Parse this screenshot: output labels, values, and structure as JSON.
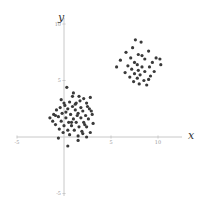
{
  "chart_data": {
    "type": "scatter",
    "title": "",
    "xlabel": "x",
    "ylabel": "y",
    "xlim": [
      -5,
      12
    ],
    "ylim": [
      -5,
      10
    ],
    "grid": false,
    "legend": "none",
    "x_ticks": [
      -5,
      5,
      10
    ],
    "y_ticks": [
      -5,
      5,
      10
    ],
    "x_tick_labels": [
      "-5",
      "5",
      "10"
    ],
    "y_tick_labels": [
      "-5",
      "5",
      "10"
    ],
    "marker_color": "#3a3a3a",
    "series": [
      {
        "name": "cluster-1",
        "points": [
          [
            0.3,
            4.4
          ],
          [
            1.0,
            3.9
          ],
          [
            1.6,
            3.6
          ],
          [
            2.1,
            3.4
          ],
          [
            2.8,
            3.5
          ],
          [
            -0.3,
            3.3
          ],
          [
            0.6,
            3.1
          ],
          [
            1.3,
            3.0
          ],
          [
            2.4,
            3.0
          ],
          [
            0.1,
            2.8
          ],
          [
            0.9,
            2.7
          ],
          [
            1.8,
            2.6
          ],
          [
            2.5,
            2.7
          ],
          [
            -0.8,
            2.4
          ],
          [
            0.4,
            2.5
          ],
          [
            1.2,
            2.4
          ],
          [
            2.0,
            2.3
          ],
          [
            2.9,
            2.3
          ],
          [
            -1.1,
            2.0
          ],
          [
            -0.2,
            2.1
          ],
          [
            0.7,
            2.0
          ],
          [
            1.5,
            2.1
          ],
          [
            2.3,
            1.9
          ],
          [
            3.0,
            2.0
          ],
          [
            -1.5,
            1.7
          ],
          [
            -0.6,
            1.8
          ],
          [
            0.2,
            1.7
          ],
          [
            1.0,
            1.6
          ],
          [
            1.8,
            1.7
          ],
          [
            2.6,
            1.6
          ],
          [
            -1.2,
            1.4
          ],
          [
            -0.3,
            1.4
          ],
          [
            0.5,
            1.3
          ],
          [
            1.3,
            1.3
          ],
          [
            2.1,
            1.3
          ],
          [
            -0.9,
            1.1
          ],
          [
            0.0,
            1.0
          ],
          [
            0.8,
            1.0
          ],
          [
            1.6,
            0.9
          ],
          [
            2.4,
            0.9
          ],
          [
            -0.5,
            0.7
          ],
          [
            0.4,
            0.6
          ],
          [
            1.1,
            0.6
          ],
          [
            1.9,
            0.5
          ],
          [
            2.8,
            0.4
          ],
          [
            0.6,
            0.2
          ],
          [
            1.5,
            0.1
          ],
          [
            2.4,
            0.0
          ],
          [
            -0.6,
            -0.1
          ],
          [
            1.5,
            -0.3
          ],
          [
            0.9,
            3.6
          ],
          [
            1.7,
            3.2
          ],
          [
            0.2,
            2.2
          ],
          [
            2.7,
            2.5
          ],
          [
            -0.4,
            2.6
          ],
          [
            1.4,
            1.9
          ],
          [
            0.8,
            1.3
          ],
          [
            2.2,
            1.1
          ],
          [
            -0.1,
            0.4
          ],
          [
            3.1,
            1.2
          ],
          [
            0.4,
            -0.8
          ],
          [
            1.2,
            2.9
          ],
          [
            -0.9,
            1.9
          ],
          [
            2.0,
            0.3
          ],
          [
            0.0,
            3.0
          ]
        ]
      },
      {
        "name": "cluster-2",
        "points": [
          [
            7.6,
            8.6
          ],
          [
            8.2,
            8.4
          ],
          [
            7.3,
            7.9
          ],
          [
            9.0,
            7.6
          ],
          [
            6.6,
            7.5
          ],
          [
            7.9,
            7.3
          ],
          [
            8.3,
            7.2
          ],
          [
            9.8,
            7.0
          ],
          [
            10.2,
            6.9
          ],
          [
            6.0,
            6.8
          ],
          [
            7.1,
            7.0
          ],
          [
            8.6,
            6.9
          ],
          [
            7.5,
            6.6
          ],
          [
            9.4,
            6.6
          ],
          [
            6.8,
            6.3
          ],
          [
            7.8,
            6.4
          ],
          [
            8.3,
            6.2
          ],
          [
            9.1,
            6.2
          ],
          [
            10.3,
            6.4
          ],
          [
            5.6,
            6.2
          ],
          [
            7.2,
            6.0
          ],
          [
            7.9,
            5.9
          ],
          [
            8.6,
            5.8
          ],
          [
            9.6,
            5.8
          ],
          [
            6.5,
            5.7
          ],
          [
            7.5,
            5.6
          ],
          [
            8.1,
            5.5
          ],
          [
            9.2,
            5.4
          ],
          [
            7.0,
            5.3
          ],
          [
            7.8,
            5.2
          ],
          [
            8.5,
            5.0
          ],
          [
            9.0,
            5.1
          ],
          [
            7.4,
            4.9
          ],
          [
            8.0,
            4.7
          ],
          [
            8.8,
            4.6
          ]
        ]
      }
    ]
  }
}
